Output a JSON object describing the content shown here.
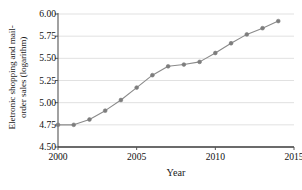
{
  "chart_data": {
    "type": "line",
    "title": "",
    "xlabel": "Year",
    "ylabel": "Eletronic shopping and mail-order sales (logarithm)",
    "ylabel_lines": [
      "Eletronic shopping and mail-",
      "order sales (logarithm)"
    ],
    "x": [
      2000,
      2001,
      2002,
      2003,
      2004,
      2005,
      2006,
      2007,
      2008,
      2009,
      2010,
      2011,
      2012,
      2013,
      2014
    ],
    "values": [
      4.75,
      4.75,
      4.81,
      4.91,
      5.03,
      5.17,
      5.31,
      5.41,
      5.43,
      5.46,
      5.56,
      5.67,
      5.77,
      5.84,
      5.92
    ],
    "series": [
      {
        "name": "Eletronic shopping and mail-order sales (logarithm)",
        "values": [
          4.75,
          4.75,
          4.81,
          4.91,
          5.03,
          5.17,
          5.31,
          5.41,
          5.43,
          5.46,
          5.56,
          5.67,
          5.77,
          5.84,
          5.92
        ]
      }
    ],
    "xlim": [
      2000,
      2015
    ],
    "ylim": [
      4.5,
      6.0
    ],
    "xticks": [
      2000,
      2005,
      2010,
      2015
    ],
    "xtick_labels": [
      "2000",
      "2005",
      "2010",
      "2015"
    ],
    "yticks": [
      4.5,
      4.75,
      5.0,
      5.25,
      5.5,
      5.75,
      6.0
    ],
    "ytick_labels": [
      "4.50",
      "4.75",
      "5.00",
      "5.25",
      "5.50",
      "5.75",
      "6.00"
    ],
    "grid": "horizontal",
    "legend": null,
    "marker": "circle",
    "line_color": "#8a8a8a",
    "marker_color": "#7d7d7d",
    "grid_color": "#d9d9d9",
    "axis_color": "#555555"
  }
}
